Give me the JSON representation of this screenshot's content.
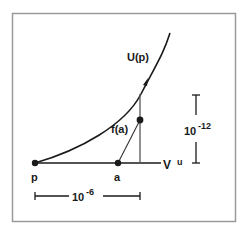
{
  "figure": {
    "frame_color": "#9a9a9a",
    "ink_color": "#1a1a1a",
    "curve_label": "U(p)",
    "point_p_label": "p",
    "point_a_label": "a",
    "segment_label": "f(a)",
    "line_label_base": "V",
    "line_label_sup": "u",
    "horizontal_scale": {
      "base": "10",
      "exponent": "-6"
    },
    "vertical_scale": {
      "base": "10",
      "exponent": "-12"
    }
  }
}
